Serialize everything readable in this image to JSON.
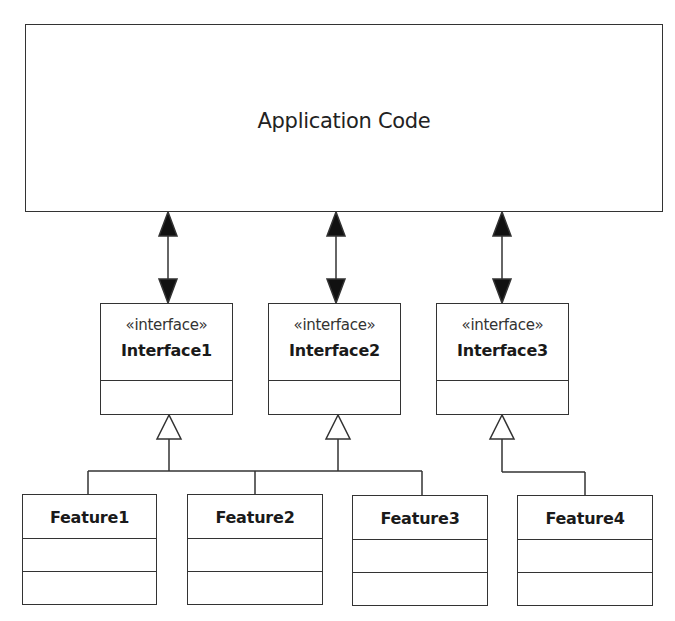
{
  "application": {
    "title": "Application Code"
  },
  "interfaces": [
    {
      "stereotype": "«interface»",
      "name": "Interface1"
    },
    {
      "stereotype": "«interface»",
      "name": "Interface2"
    },
    {
      "stereotype": "«interface»",
      "name": "Interface3"
    }
  ],
  "features": [
    {
      "name": "Feature1",
      "implements": "Interface1"
    },
    {
      "name": "Feature2",
      "implements": "Interface1"
    },
    {
      "name": "Feature3",
      "implements": "Interface2"
    },
    {
      "name": "Feature4",
      "implements": "Interface3"
    }
  ],
  "connections": [
    {
      "from": "Application Code",
      "to": "Interface1",
      "type": "bidirectional-association"
    },
    {
      "from": "Application Code",
      "to": "Interface2",
      "type": "bidirectional-association"
    },
    {
      "from": "Application Code",
      "to": "Interface3",
      "type": "bidirectional-association"
    },
    {
      "from": "Feature1",
      "to": "Interface1",
      "type": "realization"
    },
    {
      "from": "Feature2",
      "to": "Interface1",
      "type": "realization"
    },
    {
      "from": "Feature3",
      "to": "Interface2",
      "type": "realization"
    },
    {
      "from": "Feature4",
      "to": "Interface3",
      "type": "realization"
    }
  ],
  "colors": {
    "line": "#333333",
    "background": "#ffffff",
    "text": "#1a1a1a"
  }
}
